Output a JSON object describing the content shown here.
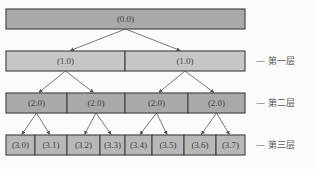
{
  "diagram": {
    "title": "",
    "colors": {
      "root_fill": "#a9a9a9",
      "level_fill": "#c6c6c6",
      "border": "#4a4a4a",
      "edge": "#555555"
    },
    "levels": [
      {
        "label": "",
        "nodes": [
          "(0.0)"
        ]
      },
      {
        "label": "— 第一层",
        "nodes": [
          "(1.0)",
          "(1.0)"
        ]
      },
      {
        "label": "— 第二层",
        "nodes": [
          "(2.0)",
          "(2.0)",
          "(2.0)",
          "(2.0)"
        ]
      },
      {
        "label": "— 第三层",
        "nodes": [
          "(3.0)",
          "(3.1)",
          "(3.2)",
          "(3.3)",
          "(3.4)",
          "(3.5)",
          "(3.6)",
          "(3.7)"
        ]
      }
    ],
    "edges": [
      {
        "from": [
          0,
          0
        ],
        "to": [
          1,
          0
        ]
      },
      {
        "from": [
          0,
          0
        ],
        "to": [
          1,
          1
        ]
      },
      {
        "from": [
          1,
          0
        ],
        "to": [
          2,
          0
        ]
      },
      {
        "from": [
          1,
          0
        ],
        "to": [
          2,
          1
        ]
      },
      {
        "from": [
          1,
          1
        ],
        "to": [
          2,
          2
        ]
      },
      {
        "from": [
          1,
          1
        ],
        "to": [
          2,
          3
        ]
      },
      {
        "from": [
          2,
          0
        ],
        "to": [
          3,
          0
        ]
      },
      {
        "from": [
          2,
          0
        ],
        "to": [
          3,
          1
        ]
      },
      {
        "from": [
          2,
          1
        ],
        "to": [
          3,
          2
        ]
      },
      {
        "from": [
          2,
          1
        ],
        "to": [
          3,
          3
        ]
      },
      {
        "from": [
          2,
          2
        ],
        "to": [
          3,
          4
        ]
      },
      {
        "from": [
          2,
          2
        ],
        "to": [
          3,
          5
        ]
      },
      {
        "from": [
          2,
          3
        ],
        "to": [
          3,
          6
        ]
      },
      {
        "from": [
          2,
          3
        ],
        "to": [
          3,
          7
        ]
      }
    ]
  }
}
